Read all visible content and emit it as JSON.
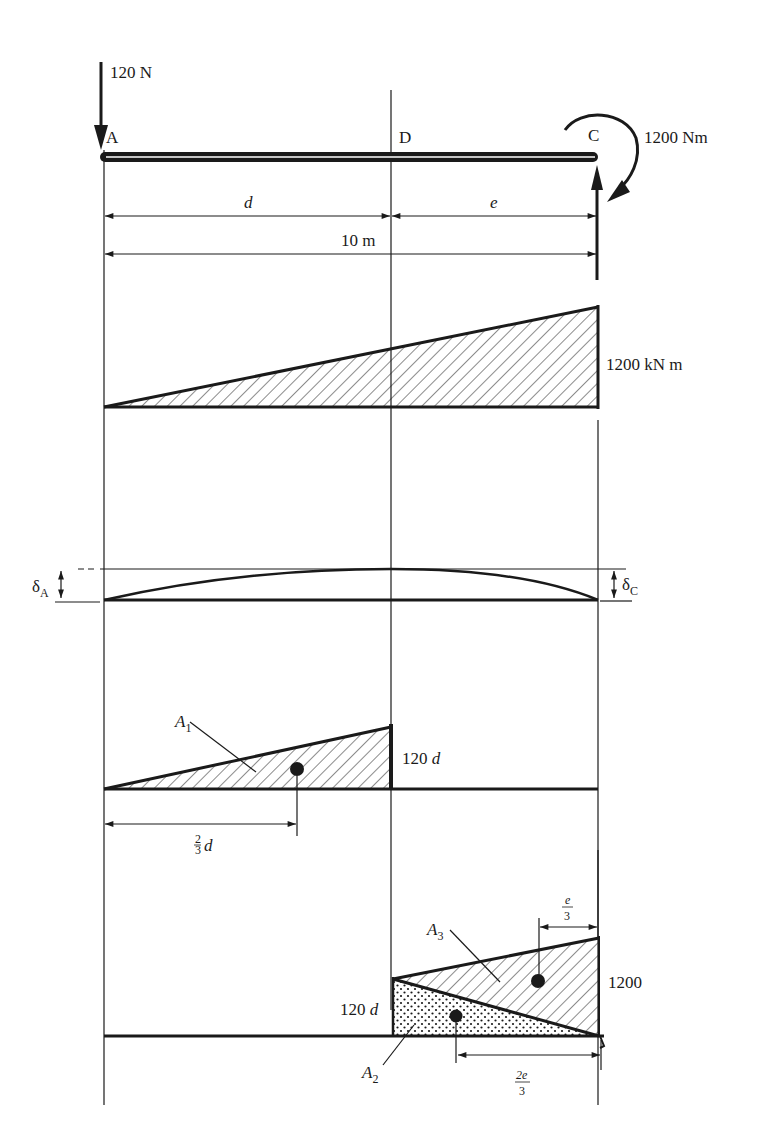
{
  "loads": {
    "point_load": "120 N",
    "moment": "1200 Nm"
  },
  "points": {
    "a": "A",
    "d": "D",
    "c": "C"
  },
  "dimensions": {
    "d": "d",
    "e": "e",
    "span": "10 m"
  },
  "bending_moment": {
    "value": "1200 kN m"
  },
  "deflection": {
    "delta_a": "δ",
    "delta_a_sub": "A",
    "delta_c": "δ",
    "delta_c_sub": "C"
  },
  "area1": {
    "label": "A",
    "label_sub": "1",
    "height": "120",
    "height_var": "d",
    "centroid_num": "2",
    "centroid_den": "3",
    "centroid_var": "d"
  },
  "area23": {
    "a3_label": "A",
    "a3_sub": "3",
    "a2_label": "A",
    "a2_sub": "2",
    "left_height": "120",
    "left_height_var": "d",
    "right_height": "1200",
    "e3_num": "e",
    "e3_den": "3",
    "e23_num": "2e",
    "e23_den": "3"
  }
}
